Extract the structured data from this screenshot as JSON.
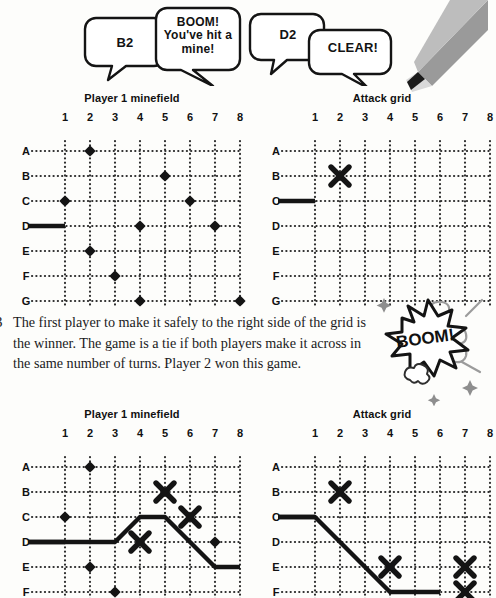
{
  "speech_bubbles": [
    {
      "id": "bubble-b2",
      "text": "B2"
    },
    {
      "id": "bubble-boom",
      "text": "BOOM! You've hit a mine!"
    },
    {
      "id": "bubble-d2",
      "text": "D2"
    },
    {
      "id": "bubble-clear",
      "text": "CLEAR!"
    }
  ],
  "instruction": {
    "bullet": "3",
    "text": "The first player to make it safely to the right side of the grid is the winner. The game is a tie if both players make it across in the same number of turns. Player 2 won this game."
  },
  "boom_badge": {
    "label": "BOOM!"
  },
  "decor": {
    "pencil_icon": "pencil-tip",
    "star_icon": "star",
    "smoke_icon": "smoke-puff"
  },
  "grids": [
    {
      "id": "minefield-top",
      "title": "Player 1 minefield",
      "columns": [
        "1",
        "2",
        "3",
        "4",
        "5",
        "6",
        "7",
        "8"
      ],
      "rows": [
        "A",
        "B",
        "C",
        "D",
        "E",
        "F",
        "G"
      ],
      "start_marker_row": "D",
      "mines": [
        {
          "row": "A",
          "col": 2
        },
        {
          "row": "B",
          "col": 5
        },
        {
          "row": "C",
          "col": 1
        },
        {
          "row": "C",
          "col": 6
        },
        {
          "row": "D",
          "col": 4
        },
        {
          "row": "D",
          "col": 7
        },
        {
          "row": "E",
          "col": 2
        },
        {
          "row": "F",
          "col": 3
        },
        {
          "row": "G",
          "col": 4
        },
        {
          "row": "G",
          "col": 8
        }
      ],
      "hits": [],
      "path": []
    },
    {
      "id": "attackgrid-top",
      "title": "Attack grid",
      "columns": [
        "1",
        "2",
        "3",
        "4",
        "5",
        "6",
        "7",
        "8"
      ],
      "rows": [
        "A",
        "B",
        "C",
        "D",
        "E",
        "F",
        "G"
      ],
      "start_marker_row": "C",
      "mines": [],
      "hits": [
        {
          "row": "B",
          "col": 2
        }
      ],
      "path": []
    },
    {
      "id": "minefield-bottom",
      "title": "Player 1 minefield",
      "columns": [
        "1",
        "2",
        "3",
        "4",
        "5",
        "6",
        "7",
        "8"
      ],
      "rows": [
        "A",
        "B",
        "C",
        "D",
        "E",
        "F"
      ],
      "start_marker_row": "D",
      "mines": [
        {
          "row": "A",
          "col": 2
        },
        {
          "row": "C",
          "col": 1
        },
        {
          "row": "D",
          "col": 7
        },
        {
          "row": "E",
          "col": 2
        },
        {
          "row": "F",
          "col": 3
        }
      ],
      "hits": [
        {
          "row": "B",
          "col": 5
        },
        {
          "row": "C",
          "col": 6
        },
        {
          "row": "D",
          "col": 4
        }
      ],
      "path": [
        {
          "row": "D",
          "col": 0
        },
        {
          "row": "D",
          "col": 3
        },
        {
          "row": "C",
          "col": 4
        },
        {
          "row": "C",
          "col": 5
        },
        {
          "row": "E",
          "col": 7
        },
        {
          "row": "E",
          "col": 8
        }
      ]
    },
    {
      "id": "attackgrid-bottom",
      "title": "Attack grid",
      "columns": [
        "1",
        "2",
        "3",
        "4",
        "5",
        "6",
        "7",
        "8"
      ],
      "rows": [
        "A",
        "B",
        "C",
        "D",
        "E",
        "F"
      ],
      "start_marker_row": "C",
      "mines": [],
      "hits": [
        {
          "row": "B",
          "col": 2
        },
        {
          "row": "E",
          "col": 4
        },
        {
          "row": "E",
          "col": 7
        },
        {
          "row": "F",
          "col": 7
        }
      ],
      "path": [
        {
          "row": "C",
          "col": 0
        },
        {
          "row": "C",
          "col": 1
        },
        {
          "row": "F",
          "col": 4
        },
        {
          "row": "F",
          "col": 6
        }
      ]
    }
  ],
  "layout": {
    "grid_positions": [
      {
        "left": 18,
        "top": 92,
        "cell": 25,
        "label_w": 22,
        "label_h": 18
      },
      {
        "left": 268,
        "top": 92,
        "cell": 25,
        "label_w": 22,
        "label_h": 18
      },
      {
        "left": 18,
        "top": 408,
        "cell": 25,
        "label_w": 22,
        "label_h": 18
      },
      {
        "left": 268,
        "top": 408,
        "cell": 25,
        "label_w": 22,
        "label_h": 18
      }
    ]
  },
  "colors": {
    "ink": "#141414",
    "paper": "#fdfdfb",
    "grid_dot": "#2b2b2b",
    "pencil_body": "#8d8d8d",
    "pencil_tip": "#1b1b1b"
  }
}
